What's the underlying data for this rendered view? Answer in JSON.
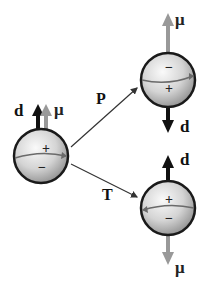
{
  "diagram": {
    "colors": {
      "d_arrow": "#111111",
      "mu_arrow": "#999999",
      "sphere_outline": "#1a1a1a",
      "sphere_fill_light": "#f2f2f2",
      "sphere_fill_dark": "#9a9a9a",
      "transform_arrow": "#333333"
    },
    "original": {
      "top_sign": "+",
      "bottom_sign": "−",
      "d_label": "d",
      "mu_label": "μ",
      "d_direction": "up",
      "mu_direction": "up"
    },
    "parity": {
      "transform_label": "P",
      "top_sign": "−",
      "bottom_sign": "+",
      "d_label": "d",
      "mu_label": "μ",
      "d_direction": "down",
      "mu_direction": "up"
    },
    "time_reversal": {
      "transform_label": "T",
      "top_sign": "+",
      "bottom_sign": "−",
      "d_label": "d",
      "mu_label": "μ",
      "d_direction": "up",
      "mu_direction": "down"
    }
  }
}
